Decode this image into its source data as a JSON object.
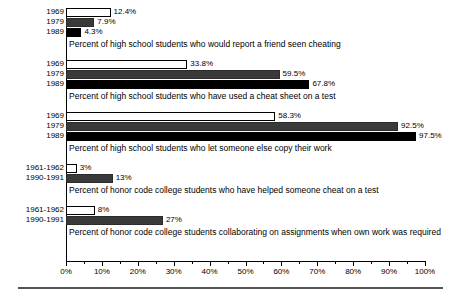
{
  "chart_data": {
    "type": "bar",
    "orientation": "horizontal",
    "title": "",
    "xlabel": "",
    "ylabel": "",
    "xlim": [
      0,
      100
    ],
    "xtick_labels": [
      "0%",
      "10%",
      "20%",
      "30%",
      "40%",
      "50%",
      "60%",
      "70%",
      "80%",
      "90%",
      "100%"
    ],
    "xtick_values": [
      0,
      10,
      20,
      30,
      40,
      50,
      60,
      70,
      80,
      90,
      100
    ],
    "minor_tick_step": 5,
    "grid": false,
    "legend": "none",
    "value_suffix": "%",
    "series_styles": {
      "open": "#ffffff",
      "gray": "#3a3a3a",
      "black": "#000000"
    },
    "groups": [
      {
        "caption": "Percent of high school students who would report  a friend seen cheating",
        "bars": [
          {
            "label": "1969",
            "value": 12.4,
            "value_text": "12.4%",
            "style": "open"
          },
          {
            "label": "1979",
            "value": 7.9,
            "value_text": "7.9%",
            "style": "gray"
          },
          {
            "label": "1989",
            "value": 4.3,
            "value_text": "4.3%",
            "style": "black"
          }
        ]
      },
      {
        "caption": "Percent of high school students who have used a cheat sheet on a test",
        "bars": [
          {
            "label": "1969",
            "value": 33.8,
            "value_text": "33.8%",
            "style": "open"
          },
          {
            "label": "1979",
            "value": 59.5,
            "value_text": "59.5%",
            "style": "gray"
          },
          {
            "label": "1989",
            "value": 67.8,
            "value_text": "67.8%",
            "style": "black"
          }
        ]
      },
      {
        "caption": "Percent of high school students who let someone else copy their work",
        "bars": [
          {
            "label": "1969",
            "value": 58.3,
            "value_text": "58.3%",
            "style": "open"
          },
          {
            "label": "1979",
            "value": 92.5,
            "value_text": "92.5%",
            "style": "gray"
          },
          {
            "label": "1989",
            "value": 97.5,
            "value_text": "97.5%",
            "style": "black"
          }
        ]
      },
      {
        "caption": "Percent of honor code college students who have helped someone cheat on a test",
        "bars": [
          {
            "label": "1961-1962",
            "value": 3,
            "value_text": "3%",
            "style": "open"
          },
          {
            "label": "1990-1991",
            "value": 13,
            "value_text": "13%",
            "style": "gray"
          }
        ]
      },
      {
        "caption": "Percent of honor code college students collaborating on assignments when own work was required",
        "bars": [
          {
            "label": "1961-1962",
            "value": 8,
            "value_text": "8%",
            "style": "open"
          },
          {
            "label": "1990-1991",
            "value": 27,
            "value_text": "27%",
            "style": "gray"
          }
        ]
      }
    ]
  }
}
